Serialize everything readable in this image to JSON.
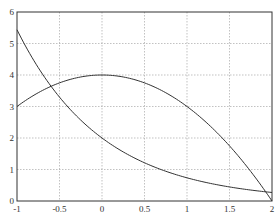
{
  "chart_data": {
    "type": "line",
    "title": "",
    "xlabel": "",
    "ylabel": "",
    "xlim": [
      -1,
      2
    ],
    "ylim": [
      0,
      6
    ],
    "grid": true,
    "xticks": [
      "-1",
      "-0.5",
      "0",
      "0.5",
      "1",
      "1.5",
      "2"
    ],
    "yticks": [
      "0",
      "1",
      "2",
      "3",
      "4",
      "5",
      "6"
    ],
    "series": [
      {
        "name": "parabola",
        "x": [
          -1,
          -0.5,
          0,
          0.5,
          1,
          1.5,
          2
        ],
        "values": [
          3,
          3.75,
          4,
          3.75,
          3,
          1.75,
          0
        ]
      },
      {
        "name": "exponential-decay",
        "x": [
          -1,
          -0.5,
          0,
          0.5,
          1,
          1.5,
          2
        ],
        "values": [
          5.44,
          3.3,
          2,
          1.21,
          0.74,
          0.45,
          0.27
        ]
      }
    ],
    "line_color": "#333333"
  }
}
